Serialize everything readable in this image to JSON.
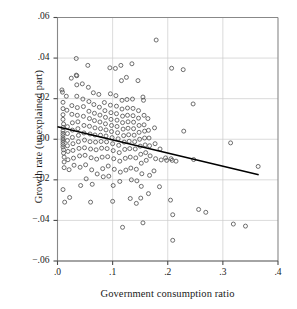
{
  "chart_data": {
    "type": "scatter",
    "title": "",
    "xlabel": "Government consumption ratio",
    "ylabel": "Growth rate (unexplained part)",
    "xlim": [
      0.0,
      0.4
    ],
    "ylim": [
      -0.06,
      0.06
    ],
    "xticks": [
      0.0,
      0.1,
      0.2,
      0.3,
      0.4
    ],
    "xticklabels": [
      ".0",
      ".1",
      ".2",
      ".3",
      ".4"
    ],
    "yticks": [
      -0.06,
      -0.04,
      -0.02,
      0.0,
      0.02,
      0.04,
      0.06
    ],
    "yticklabels": [
      "−.06",
      "−.04",
      "−.02",
      ".00",
      ".02",
      ".04",
      ".06"
    ],
    "grid": true,
    "grid_color": "#cccccc",
    "marker": "open-circle",
    "marker_size": 4,
    "marker_color": "#555555",
    "frame_color": "#888888",
    "background": "#ffffff",
    "legend": null,
    "series": [
      {
        "name": "countries",
        "type": "scatter",
        "points": [
          [
            0.008,
            0.0243
          ],
          [
            0.009,
            0.0232
          ],
          [
            0.01,
            0.0182
          ],
          [
            0.01,
            0.0151
          ],
          [
            0.01,
            0.0121
          ],
          [
            0.01,
            0.0098
          ],
          [
            0.011,
            0.0075
          ],
          [
            0.01,
            0.0058
          ],
          [
            0.01,
            0.0041
          ],
          [
            0.01,
            0.0029
          ],
          [
            0.01,
            0.0018
          ],
          [
            0.01,
            0.0006
          ],
          [
            0.01,
            -0.0004
          ],
          [
            0.01,
            -0.0015
          ],
          [
            0.01,
            -0.0026
          ],
          [
            0.01,
            -0.0038
          ],
          [
            0.011,
            -0.0052
          ],
          [
            0.011,
            -0.0068
          ],
          [
            0.012,
            -0.0088
          ],
          [
            0.012,
            -0.0112
          ],
          [
            0.012,
            -0.014
          ],
          [
            0.01,
            -0.0248
          ],
          [
            0.013,
            -0.031
          ],
          [
            0.016,
            0.0212
          ],
          [
            0.017,
            0.0143
          ],
          [
            0.018,
            0.0062
          ],
          [
            0.018,
            0.0028
          ],
          [
            0.018,
            -0.0006
          ],
          [
            0.018,
            -0.0032
          ],
          [
            0.019,
            -0.006
          ],
          [
            0.019,
            -0.0101
          ],
          [
            0.021,
            -0.015
          ],
          [
            0.022,
            -0.0287
          ],
          [
            0.025,
            0.0301
          ],
          [
            0.026,
            0.0166
          ],
          [
            0.026,
            0.0123
          ],
          [
            0.027,
            0.0081
          ],
          [
            0.027,
            0.0045
          ],
          [
            0.027,
            0.0009
          ],
          [
            0.028,
            -0.0022
          ],
          [
            0.028,
            -0.0055
          ],
          [
            0.029,
            -0.0093
          ],
          [
            0.03,
            -0.0128
          ],
          [
            0.034,
            0.0398
          ],
          [
            0.034,
            0.0316
          ],
          [
            0.035,
            0.0313
          ],
          [
            0.035,
            0.0268
          ],
          [
            0.035,
            0.0212
          ],
          [
            0.036,
            0.0156
          ],
          [
            0.036,
            0.0118
          ],
          [
            0.037,
            0.0086
          ],
          [
            0.037,
            0.0052
          ],
          [
            0.038,
            0.0019
          ],
          [
            0.038,
            -0.0012
          ],
          [
            0.039,
            -0.0045
          ],
          [
            0.04,
            -0.0082
          ],
          [
            0.041,
            -0.0138
          ],
          [
            0.042,
            -0.0228
          ],
          [
            0.045,
            0.0273
          ],
          [
            0.046,
            0.0198
          ],
          [
            0.047,
            0.0161
          ],
          [
            0.047,
            0.0113
          ],
          [
            0.048,
            0.0068
          ],
          [
            0.048,
            0.0031
          ],
          [
            0.049,
            -0.0004
          ],
          [
            0.049,
            -0.0042
          ],
          [
            0.05,
            -0.0079
          ],
          [
            0.051,
            -0.0126
          ],
          [
            0.052,
            -0.0195
          ],
          [
            0.055,
            0.0364
          ],
          [
            0.056,
            0.0256
          ],
          [
            0.057,
            0.0186
          ],
          [
            0.057,
            0.0138
          ],
          [
            0.058,
            0.0102
          ],
          [
            0.058,
            0.0064
          ],
          [
            0.059,
            0.0026
          ],
          [
            0.059,
            -0.0012
          ],
          [
            0.06,
            -0.0048
          ],
          [
            0.061,
            -0.0091
          ],
          [
            0.062,
            -0.0151
          ],
          [
            0.063,
            -0.0222
          ],
          [
            0.06,
            -0.031
          ],
          [
            0.065,
            0.0229
          ],
          [
            0.066,
            0.0171
          ],
          [
            0.067,
            0.0128
          ],
          [
            0.067,
            0.0092
          ],
          [
            0.068,
            0.0056
          ],
          [
            0.068,
            0.0021
          ],
          [
            0.069,
            -0.0014
          ],
          [
            0.07,
            -0.0052
          ],
          [
            0.071,
            -0.0098
          ],
          [
            0.072,
            -0.0171
          ],
          [
            0.075,
            0.0221
          ],
          [
            0.076,
            0.0158
          ],
          [
            0.077,
            0.0119
          ],
          [
            0.077,
            0.0085
          ],
          [
            0.078,
            0.0052
          ],
          [
            0.078,
            0.002
          ],
          [
            0.079,
            -0.0011
          ],
          [
            0.08,
            -0.0044
          ],
          [
            0.081,
            -0.0088
          ],
          [
            0.082,
            -0.0145
          ],
          [
            0.083,
            -0.0185
          ],
          [
            0.085,
            0.0181
          ],
          [
            0.086,
            0.0141
          ],
          [
            0.087,
            0.0108
          ],
          [
            0.087,
            0.0076
          ],
          [
            0.088,
            0.0046
          ],
          [
            0.088,
            0.0016
          ],
          [
            0.089,
            -0.0013
          ],
          [
            0.09,
            -0.0046
          ],
          [
            0.091,
            -0.0086
          ],
          [
            0.092,
            -0.0132
          ],
          [
            0.093,
            -0.0182
          ],
          [
            0.095,
            0.0352
          ],
          [
            0.096,
            0.0224
          ],
          [
            0.096,
            0.0168
          ],
          [
            0.097,
            0.0131
          ],
          [
            0.097,
            0.0098
          ],
          [
            0.098,
            0.0068
          ],
          [
            0.098,
            0.0038
          ],
          [
            0.099,
            0.0008
          ],
          [
            0.1,
            -0.0022
          ],
          [
            0.101,
            -0.0056
          ],
          [
            0.102,
            -0.0096
          ],
          [
            0.103,
            -0.0148
          ],
          [
            0.101,
            -0.0228
          ],
          [
            0.1,
            -0.0306
          ],
          [
            0.105,
            0.0349
          ],
          [
            0.106,
            0.0215
          ],
          [
            0.107,
            0.0163
          ],
          [
            0.107,
            0.0126
          ],
          [
            0.108,
            0.0094
          ],
          [
            0.108,
            0.0063
          ],
          [
            0.109,
            0.0032
          ],
          [
            0.11,
            0.0002
          ],
          [
            0.111,
            -0.003
          ],
          [
            0.112,
            -0.0066
          ],
          [
            0.113,
            -0.0108
          ],
          [
            0.114,
            -0.0162
          ],
          [
            0.113,
            -0.0208
          ],
          [
            0.115,
            0.0364
          ],
          [
            0.116,
            0.0289
          ],
          [
            0.117,
            0.0192
          ],
          [
            0.117,
            0.0149
          ],
          [
            0.118,
            0.0114
          ],
          [
            0.118,
            0.0082
          ],
          [
            0.119,
            0.005
          ],
          [
            0.12,
            0.0018
          ],
          [
            0.121,
            -0.0014
          ],
          [
            0.122,
            -0.005
          ],
          [
            0.123,
            -0.0094
          ],
          [
            0.124,
            -0.0152
          ],
          [
            0.118,
            -0.0434
          ],
          [
            0.125,
            0.0305
          ],
          [
            0.126,
            0.0196
          ],
          [
            0.127,
            0.0154
          ],
          [
            0.127,
            0.0118
          ],
          [
            0.128,
            0.0086
          ],
          [
            0.128,
            0.0054
          ],
          [
            0.129,
            0.0022
          ],
          [
            0.13,
            -0.001
          ],
          [
            0.131,
            -0.0046
          ],
          [
            0.132,
            -0.0088
          ],
          [
            0.133,
            -0.0142
          ],
          [
            0.134,
            -0.02
          ],
          [
            0.132,
            -0.0292
          ],
          [
            0.135,
            0.0372
          ],
          [
            0.136,
            0.0198
          ],
          [
            0.137,
            0.0152
          ],
          [
            0.137,
            0.0116
          ],
          [
            0.138,
            0.0084
          ],
          [
            0.138,
            0.0052
          ],
          [
            0.139,
            0.002
          ],
          [
            0.14,
            -0.0012
          ],
          [
            0.141,
            -0.0048
          ],
          [
            0.142,
            -0.0092
          ],
          [
            0.143,
            -0.0148
          ],
          [
            0.144,
            -0.0205
          ],
          [
            0.143,
            -0.0316
          ],
          [
            0.146,
            0.0289
          ],
          [
            0.147,
            0.0141
          ],
          [
            0.147,
            0.0104
          ],
          [
            0.148,
            0.0068
          ],
          [
            0.148,
            0.0034
          ],
          [
            0.149,
            0.0
          ],
          [
            0.15,
            -0.0034
          ],
          [
            0.151,
            -0.0074
          ],
          [
            0.152,
            -0.0118
          ],
          [
            0.153,
            -0.017
          ],
          [
            0.152,
            -0.0232
          ],
          [
            0.151,
            -0.029
          ],
          [
            0.155,
            0.0208
          ],
          [
            0.156,
            0.0192
          ],
          [
            0.157,
            0.0118
          ],
          [
            0.157,
            0.0071
          ],
          [
            0.158,
            0.004
          ],
          [
            0.158,
            0.0006
          ],
          [
            0.159,
            -0.0028
          ],
          [
            0.16,
            -0.0066
          ],
          [
            0.161,
            -0.0104
          ],
          [
            0.155,
            -0.0412
          ],
          [
            0.164,
            0.0102
          ],
          [
            0.165,
            0.0044
          ],
          [
            0.166,
            0.0006
          ],
          [
            0.167,
            -0.0032
          ],
          [
            0.168,
            -0.0082
          ],
          [
            0.167,
            -0.0178
          ],
          [
            0.165,
            -0.0268
          ],
          [
            0.179,
            0.0489
          ],
          [
            0.176,
            0.0056
          ],
          [
            0.177,
            -0.0022
          ],
          [
            0.178,
            -0.0096
          ],
          [
            0.175,
            -0.0156
          ],
          [
            0.186,
            -0.0048
          ],
          [
            0.188,
            -0.0102
          ],
          [
            0.185,
            -0.0234
          ],
          [
            0.196,
            -0.0092
          ],
          [
            0.198,
            -0.0104
          ],
          [
            0.207,
            0.035
          ],
          [
            0.206,
            -0.0096
          ],
          [
            0.208,
            -0.0104
          ],
          [
            0.205,
            -0.03
          ],
          [
            0.209,
            -0.0372
          ],
          [
            0.209,
            -0.0498
          ],
          [
            0.215,
            -0.0108
          ],
          [
            0.228,
            0.0343
          ],
          [
            0.229,
            0.004
          ],
          [
            0.246,
            0.0174
          ],
          [
            0.247,
            -0.01
          ],
          [
            0.256,
            -0.0346
          ],
          [
            0.269,
            -0.036
          ],
          [
            0.314,
            -0.0018
          ],
          [
            0.319,
            -0.0418
          ],
          [
            0.341,
            -0.0428
          ],
          [
            0.364,
            -0.0134
          ]
        ]
      },
      {
        "name": "fitted-regression-line",
        "type": "line",
        "points": [
          [
            0.0,
            0.0062
          ],
          [
            0.365,
            -0.0175
          ]
        ],
        "color": "#000000",
        "width": 1.6
      }
    ]
  }
}
